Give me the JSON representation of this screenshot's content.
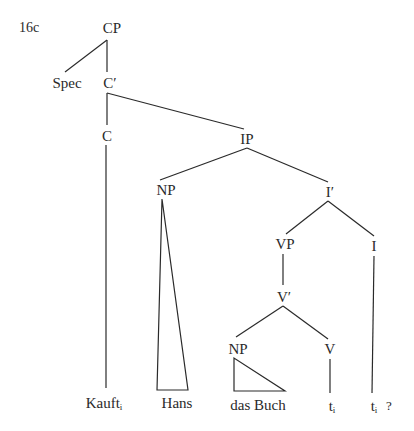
{
  "diagram": {
    "type": "syntax-tree",
    "example_number": "16c",
    "nodes": {
      "cp": "CP",
      "spec": "Spec",
      "c_bar": "C′",
      "c": "C",
      "ip": "IP",
      "np_subj": "NP",
      "i_bar": "I′",
      "vp": "VP",
      "i": "I",
      "v_bar": "V′",
      "np_obj": "NP",
      "v": "V"
    },
    "leaves": {
      "kauft": {
        "word": "Kauft",
        "index": "i"
      },
      "hans": {
        "word": "Hans"
      },
      "das_buch": {
        "word": "das Buch"
      },
      "trace_v": {
        "word": "t",
        "index": "i"
      },
      "trace_i": {
        "word": "t",
        "index": "i"
      },
      "question_mark": "?"
    },
    "edges": [
      [
        "CP",
        "Spec"
      ],
      [
        "CP",
        "C′"
      ],
      [
        "C′",
        "C"
      ],
      [
        "C′",
        "IP"
      ],
      [
        "C",
        "Kauft_i"
      ],
      [
        "IP",
        "NP"
      ],
      [
        "IP",
        "I′"
      ],
      [
        "NP",
        "Hans (triangle)"
      ],
      [
        "I′",
        "VP"
      ],
      [
        "I′",
        "I"
      ],
      [
        "VP",
        "V′"
      ],
      [
        "V′",
        "NP"
      ],
      [
        "V′",
        "V"
      ],
      [
        "NP",
        "das Buch (triangle)"
      ],
      [
        "V",
        "t_i"
      ],
      [
        "I",
        "t_i"
      ]
    ]
  }
}
